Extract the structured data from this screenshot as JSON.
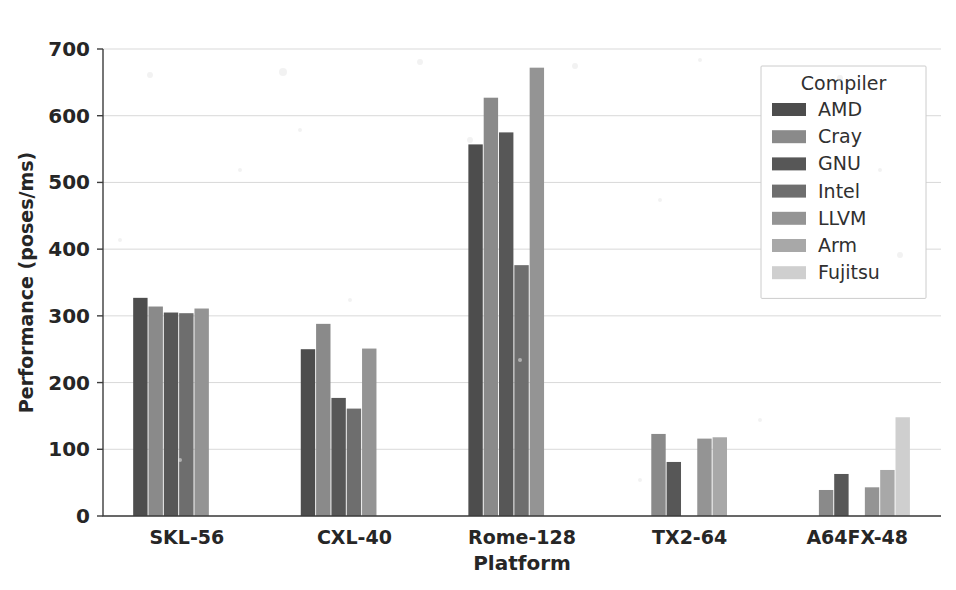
{
  "chart_data": {
    "type": "bar",
    "title": "",
    "xlabel": "Platform",
    "ylabel": "Performance (poses/ms)",
    "categories": [
      "SKL-56",
      "CXL-40",
      "Rome-128",
      "TX2-64",
      "A64FX-48"
    ],
    "legend_title": "Compiler",
    "legend_position": "upper right",
    "grid": true,
    "ylim": [
      0,
      700
    ],
    "yticks": [
      0,
      100,
      200,
      300,
      400,
      500,
      600,
      700
    ],
    "ytick_labels": [
      "0",
      "100",
      "200",
      "300",
      "400",
      "500",
      "600",
      "700"
    ],
    "series": [
      {
        "name": "AMD",
        "color": "#4d4d4d",
        "values": [
          327,
          250,
          557,
          null,
          null
        ]
      },
      {
        "name": "Cray",
        "color": "#8a8a8a",
        "values": [
          314,
          288,
          627,
          123,
          39
        ]
      },
      {
        "name": "GNU",
        "color": "#575757",
        "values": [
          305,
          177,
          575,
          81,
          63
        ]
      },
      {
        "name": "Intel",
        "color": "#6e6e6e",
        "values": [
          304,
          161,
          376,
          null,
          null
        ]
      },
      {
        "name": "LLVM",
        "color": "#949494",
        "values": [
          311,
          251,
          672,
          116,
          43
        ]
      },
      {
        "name": "Arm",
        "color": "#a8a8a8",
        "values": [
          null,
          null,
          null,
          118,
          69
        ]
      },
      {
        "name": "Fujitsu",
        "color": "#cfcfcf",
        "values": [
          null,
          null,
          null,
          null,
          148
        ]
      }
    ]
  },
  "figure": {
    "background": "#ffffff",
    "grid_color": "#d9d9d9",
    "axis_color": "#3d3d3d",
    "text_color": "#262626"
  }
}
